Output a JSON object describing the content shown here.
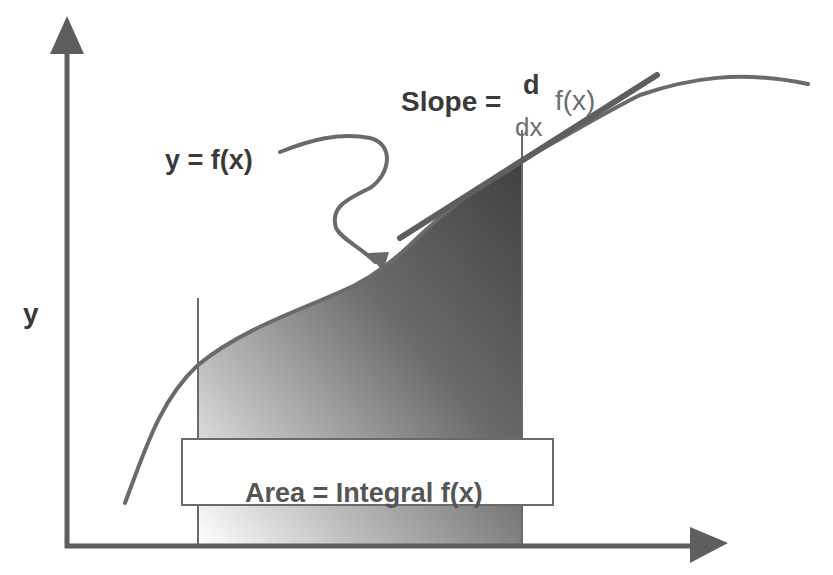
{
  "diagram": {
    "labels": {
      "y_axis": "y",
      "function": "y = f(x)",
      "slope_prefix": "Slope =",
      "slope_numerator": "d",
      "slope_denominator": "dx",
      "slope_function": "f(x)",
      "area": "Area = Integral f(x)"
    },
    "elements": [
      {
        "id": "y-axis",
        "type": "arrow",
        "direction": "up"
      },
      {
        "id": "x-axis",
        "type": "arrow",
        "direction": "right"
      },
      {
        "id": "curve",
        "type": "curve",
        "label": "y = f(x)"
      },
      {
        "id": "tangent-line",
        "type": "line",
        "label": "Slope = d/dx f(x)"
      },
      {
        "id": "shaded-area",
        "type": "region",
        "label": "Area = Integral f(x)"
      },
      {
        "id": "pointer-arrow",
        "type": "arrow",
        "from": "y = f(x)",
        "to": "curve"
      }
    ],
    "colors": {
      "stroke": "#6a6a6a",
      "axis": "#5e5e5e",
      "fill_dark": "#4a4a4a",
      "fill_light": "#ffffff",
      "text": "#3a3a3a"
    }
  }
}
